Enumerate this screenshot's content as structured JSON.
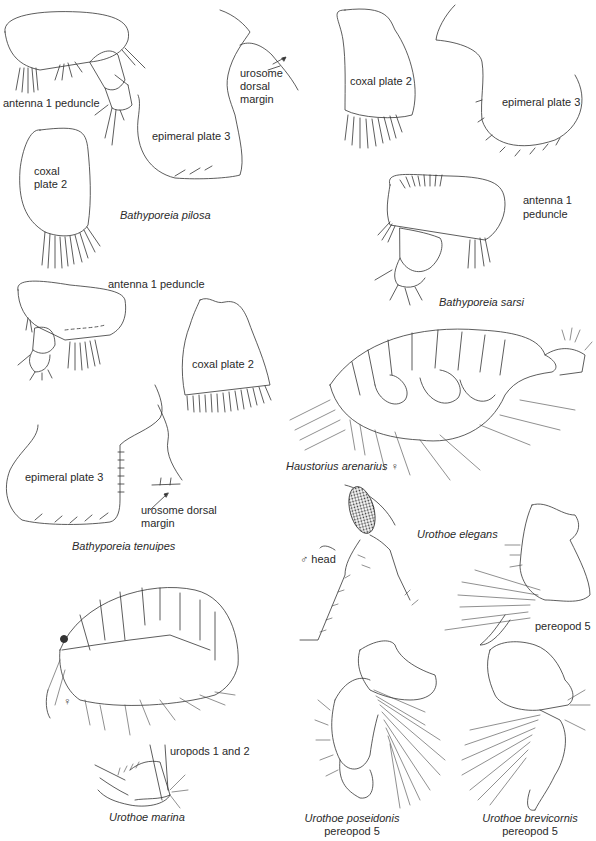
{
  "figure": {
    "panels": [
      {
        "species": "Bathyporeia pilosa",
        "labels": {
          "antenna": "antenna 1 peduncle",
          "coxal": "coxal plate 2",
          "epimeral": "epimeral plate 3",
          "urosome": "urosome dorsal margin"
        }
      },
      {
        "species": "Bathyporeia sarsi",
        "labels": {
          "coxal": "coxal plate 2",
          "epimeral": "epimeral plate 3",
          "antenna": "antenna 1 peduncle"
        }
      },
      {
        "species": "Bathyporeia tenuipes",
        "labels": {
          "antenna": "antenna 1 peduncle",
          "coxal": "coxal plate 2",
          "epimeral": "epimeral plate 3",
          "urosome": "urosome dorsal margin"
        }
      },
      {
        "species": "Haustorius arenarius",
        "sex_symbol": "♀"
      },
      {
        "species": "Urothoe elegans",
        "labels": {
          "head": "♂ head",
          "pereopod": "pereopod 5"
        }
      },
      {
        "species": "Urothoe marina",
        "sex_symbol": "♀",
        "labels": {
          "uropods": "uropods 1 and 2"
        }
      },
      {
        "species": "Urothoe poseidonis",
        "labels": {
          "pereopod": "pereopod 5"
        }
      },
      {
        "species": "Urothoe brevicornis",
        "labels": {
          "pereopod": "pereopod 5"
        }
      }
    ],
    "split_labels": {
      "pilosa_urosome_1": "urosome",
      "pilosa_urosome_2": "dorsal",
      "pilosa_urosome_3": "margin",
      "pilosa_coxal_1": "coxal",
      "pilosa_coxal_2": "plate 2",
      "sarsi_antenna_1": "antenna 1",
      "sarsi_antenna_2": "peduncle",
      "tenuipes_urosome_1": "urosome dorsal",
      "tenuipes_urosome_2": "margin"
    }
  }
}
